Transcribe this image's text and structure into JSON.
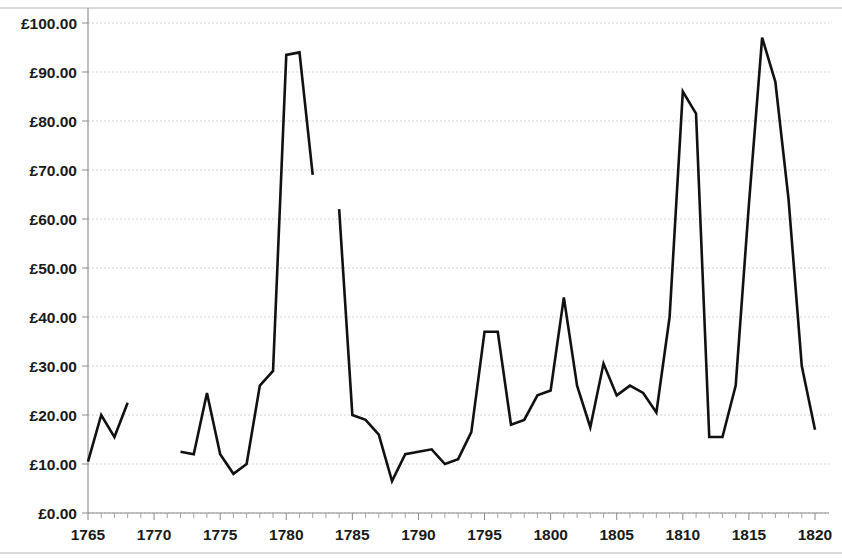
{
  "chart_data": {
    "type": "line",
    "title": "",
    "subtitle": "",
    "xlabel": "",
    "ylabel": "",
    "xlim": [
      1764,
      1820.5
    ],
    "ylim": [
      0,
      100
    ],
    "y_tick_values": [
      0,
      10,
      20,
      30,
      40,
      50,
      60,
      70,
      80,
      90,
      100
    ],
    "y_tick_labels": [
      "£0.00",
      "£10.00",
      "£20.00",
      "£30.00",
      "£40.00",
      "£50.00",
      "£60.00",
      "£70.00",
      "£80.00",
      "£90.00",
      "£100.00"
    ],
    "x_tick_values": [
      1765,
      1770,
      1775,
      1780,
      1785,
      1790,
      1795,
      1800,
      1805,
      1810,
      1815,
      1820
    ],
    "x_tick_labels": [
      "1765",
      "1770",
      "1775",
      "1780",
      "1785",
      "1790",
      "1795",
      "1800",
      "1805",
      "1810",
      "1815",
      "1820"
    ],
    "x_minor_tick_step": 1,
    "grid": "horizontal",
    "legend": "none",
    "currency_symbol": "£",
    "line_color": "#111111",
    "grid_color": "#c8c8d2",
    "axis_color": "#8a8a8a",
    "background_color": "#ffffff",
    "series": [
      {
        "name": "series-1",
        "segments": [
          {
            "x": [
              1765,
              1766,
              1767,
              1768
            ],
            "y": [
              10.5,
              20.0,
              15.5,
              22.5
            ]
          },
          {
            "x": [
              1772,
              1773,
              1774,
              1775,
              1776,
              1777,
              1778,
              1779,
              1780,
              1781,
              1782
            ],
            "y": [
              12.5,
              12.0,
              24.5,
              12.0,
              8.0,
              10.0,
              26.0,
              29.0,
              93.5,
              94.0,
              69.0
            ]
          },
          {
            "x": [
              1784,
              1785,
              1786,
              1787,
              1788,
              1789,
              1790,
              1791,
              1792,
              1793,
              1794,
              1795,
              1796,
              1797,
              1798,
              1799,
              1800,
              1801,
              1802,
              1803,
              1804,
              1805,
              1806,
              1807,
              1808,
              1809,
              1810,
              1811,
              1812,
              1813,
              1814,
              1815,
              1816,
              1817,
              1818,
              1819,
              1820
            ],
            "y": [
              62.0,
              20.0,
              19.0,
              16.0,
              6.5,
              12.0,
              12.5,
              13.0,
              10.0,
              11.0,
              16.5,
              37.0,
              37.0,
              18.0,
              19.0,
              24.0,
              25.0,
              44.0,
              26.0,
              17.5,
              30.5,
              24.0,
              26.0,
              24.5,
              20.5,
              40.0,
              86.0,
              81.5,
              15.5,
              15.5,
              26.0,
              63.0,
              97.0,
              88.0,
              64.0,
              30.0,
              17.0
            ]
          }
        ]
      }
    ]
  }
}
